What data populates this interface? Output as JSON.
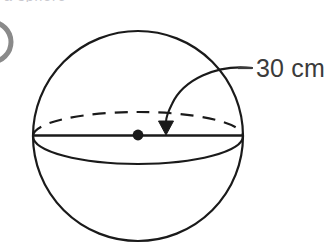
{
  "figure": {
    "kind": "geometry-diagram",
    "subject": "sphere",
    "background_color": "#ffffff",
    "stroke_color": "#1a1a1a",
    "label": {
      "value": "30",
      "unit": "cm",
      "text": "30 cm",
      "text_color": "#3b3b3b",
      "leader_dash_mark": "—"
    },
    "parts": [
      {
        "name": "sphere-outline",
        "type": "circle",
        "label": "sphere outline"
      },
      {
        "name": "equator-back-arc",
        "type": "dashed-arc",
        "label": "hidden back half of equator"
      },
      {
        "name": "equator-front-arc",
        "type": "arc",
        "label": "visible front half of equator"
      },
      {
        "name": "diameter-line",
        "type": "line",
        "label": "horizontal diameter"
      },
      {
        "name": "centre-dot",
        "type": "point",
        "label": "centre of sphere"
      },
      {
        "name": "leader-curve",
        "type": "curve",
        "label": "curved leader line"
      },
      {
        "name": "arrowhead",
        "type": "triangle",
        "label": "arrow pointing to radius"
      }
    ],
    "geometry": {
      "circle_center_x": 138,
      "circle_center_y": 136,
      "circle_radius": 105,
      "equator_semi_minor": 26,
      "centre_dot_radius": 5,
      "arrow_tip_x": 166,
      "arrow_tip_y": 135
    },
    "cropped_top_text": "a sphere"
  }
}
